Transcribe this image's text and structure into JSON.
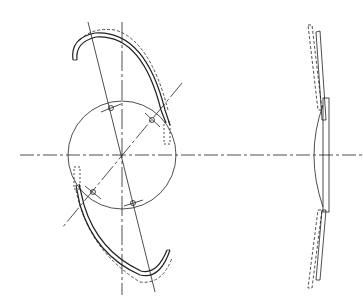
{
  "diagram": {
    "type": "technical-drawing",
    "views": [
      "front-view",
      "side-view"
    ],
    "stroke_color": "#222222",
    "background": "#ffffff",
    "labels": []
  }
}
